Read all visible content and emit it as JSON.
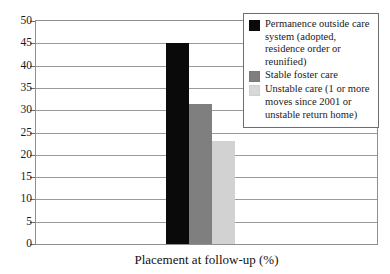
{
  "chart_data": {
    "type": "bar",
    "title": "",
    "xlabel": "Placement at follow-up (%)",
    "ylabel": "",
    "categories": [
      "Permanence outside care system (adopted, residence order or reunified)",
      "Stable foster care",
      "Unstable care (1 or more moves since 2001 or unstable return home)"
    ],
    "values": [
      45,
      31.5,
      23
    ],
    "ylim": [
      0,
      50
    ],
    "yticks": [
      "0",
      "5",
      "10",
      "15",
      "20",
      "25",
      "30",
      "35",
      "40",
      "45",
      "50"
    ],
    "grid": true,
    "legend_position": "top-right",
    "series_colors": [
      "#0a0a0a",
      "#7f7f7f",
      "#d8d8d8"
    ]
  },
  "legend": {
    "entries": [
      {
        "label": "Permanence outside care system (adopted, residence order or reunified)",
        "color": "#0a0a0a",
        "swatch_name": "legend-swatch-permanence"
      },
      {
        "label": "Stable foster care",
        "color": "#7f7f7f",
        "swatch_name": "legend-swatch-stable-foster-care"
      },
      {
        "label": "Unstable care (1 or more moves since 2001 or unstable return home)",
        "color": "#d8d8d8",
        "swatch_name": "legend-swatch-unstable-care"
      }
    ]
  },
  "axis": {
    "x_caption": "Placement at follow-up (%)"
  }
}
